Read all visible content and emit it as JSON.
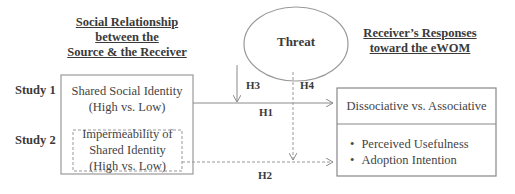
{
  "left_heading": {
    "line1": "Social Relationship",
    "line2": "between the",
    "line3": "Source & the Receiver"
  },
  "right_heading": {
    "line1": "Receiver’s Responses",
    "line2": "toward the eWOM"
  },
  "moderator": {
    "label": "Threat"
  },
  "studies": [
    {
      "label": "Study 1",
      "box": {
        "line1": "Shared Social Identity",
        "line2": "(High vs. Low)"
      }
    },
    {
      "label": "Study 2",
      "box": {
        "line1": "Impermeability of",
        "line2": "Shared Identity",
        "line3": "(High vs. Low)"
      }
    }
  ],
  "outcomes": {
    "top": "Dissociative vs. Associative",
    "bullets": [
      "Perceived Usefulness",
      "Adoption Intention"
    ]
  },
  "hypotheses": {
    "h1": "H1",
    "h2": "H2",
    "h3": "H3",
    "h4": "H4"
  },
  "colors": {
    "line": "#8a8a8a",
    "text": "#3a3a3a"
  }
}
